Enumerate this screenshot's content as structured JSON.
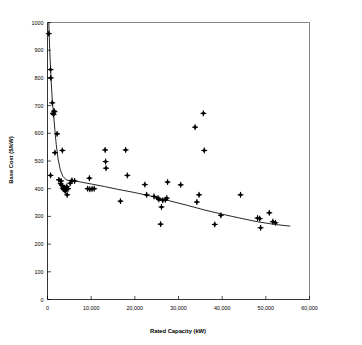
{
  "chart_data": {
    "type": "scatter",
    "title": "",
    "xlabel": "Rated Capacity (kW)",
    "ylabel": "Base Cost ($/kW)",
    "xlim": [
      0,
      60000
    ],
    "ylim": [
      0,
      1000
    ],
    "grid": false,
    "legend": "none",
    "marker_style": "diamond",
    "marker_color": "#000000",
    "xticks": [
      0,
      10000,
      20000,
      30000,
      40000,
      50000,
      60000
    ],
    "xtick_labels": [
      "0",
      "10,000",
      "20,000",
      "30,000",
      "40,000",
      "50,000",
      "60,000"
    ],
    "yticks": [
      0,
      100,
      200,
      300,
      400,
      500,
      600,
      700,
      800,
      900,
      1000
    ],
    "ytick_labels": [
      "0",
      "100",
      "200",
      "300",
      "400",
      "500",
      "600",
      "700",
      "800",
      "900",
      "1000"
    ],
    "series": [
      {
        "name": "Base Cost vs Rated Capacity",
        "type": "scatter",
        "points": [
          [
            300,
            960
          ],
          [
            700,
            830
          ],
          [
            750,
            800
          ],
          [
            1100,
            710
          ],
          [
            1250,
            672
          ],
          [
            1400,
            668
          ],
          [
            1500,
            680
          ],
          [
            1600,
            678
          ],
          [
            2200,
            598
          ],
          [
            1700,
            530
          ],
          [
            3400,
            538
          ],
          [
            700,
            448
          ],
          [
            2600,
            432
          ],
          [
            3100,
            428
          ],
          [
            3000,
            418
          ],
          [
            3300,
            412
          ],
          [
            3500,
            402
          ],
          [
            3700,
            398
          ],
          [
            3800,
            404
          ],
          [
            3900,
            396
          ],
          [
            4000,
            400
          ],
          [
            4100,
            392
          ],
          [
            4300,
            398
          ],
          [
            4400,
            408
          ],
          [
            4500,
            378
          ],
          [
            4700,
            400
          ],
          [
            5200,
            420
          ],
          [
            5600,
            430
          ],
          [
            6200,
            428
          ],
          [
            9200,
            400
          ],
          [
            9700,
            398
          ],
          [
            10200,
            399
          ],
          [
            10700,
            400
          ],
          [
            9600,
            438
          ],
          [
            13200,
            540
          ],
          [
            13300,
            498
          ],
          [
            13400,
            474
          ],
          [
            17900,
            540
          ],
          [
            18300,
            448
          ],
          [
            16700,
            355
          ],
          [
            22300,
            415
          ],
          [
            22700,
            378
          ],
          [
            24400,
            372
          ],
          [
            25300,
            366
          ],
          [
            25500,
            361
          ],
          [
            26100,
            334
          ],
          [
            26400,
            358
          ],
          [
            27000,
            360
          ],
          [
            27300,
            366
          ],
          [
            27500,
            424
          ],
          [
            25900,
            272
          ],
          [
            30500,
            414
          ],
          [
            33800,
            622
          ],
          [
            34200,
            352
          ],
          [
            34700,
            378
          ],
          [
            35700,
            672
          ],
          [
            35900,
            538
          ],
          [
            38300,
            271
          ],
          [
            39700,
            304
          ],
          [
            44200,
            378
          ],
          [
            48100,
            294
          ],
          [
            48600,
            292
          ],
          [
            48800,
            259
          ],
          [
            50800,
            313
          ],
          [
            51600,
            281
          ],
          [
            52200,
            277
          ]
        ]
      },
      {
        "name": "Fitted trend curve",
        "type": "line",
        "points": [
          [
            300,
            1000
          ],
          [
            500,
            905
          ],
          [
            800,
            800
          ],
          [
            1100,
            718
          ],
          [
            1400,
            665
          ],
          [
            1700,
            610
          ],
          [
            2000,
            560
          ],
          [
            2400,
            510
          ],
          [
            2900,
            470
          ],
          [
            3500,
            445
          ],
          [
            4300,
            432
          ],
          [
            5200,
            428
          ],
          [
            6200,
            428
          ],
          [
            8000,
            423
          ],
          [
            10000,
            417
          ],
          [
            13000,
            408
          ],
          [
            16000,
            398
          ],
          [
            20000,
            386
          ],
          [
            24000,
            372
          ],
          [
            28000,
            356
          ],
          [
            32000,
            340
          ],
          [
            36000,
            323
          ],
          [
            40000,
            308
          ],
          [
            44000,
            294
          ],
          [
            48000,
            281
          ],
          [
            52000,
            271
          ],
          [
            55500,
            265
          ]
        ]
      }
    ]
  },
  "axes": {
    "x_title": "Rated Capacity (kW)",
    "y_title": "Base Cost ($/kW)"
  }
}
